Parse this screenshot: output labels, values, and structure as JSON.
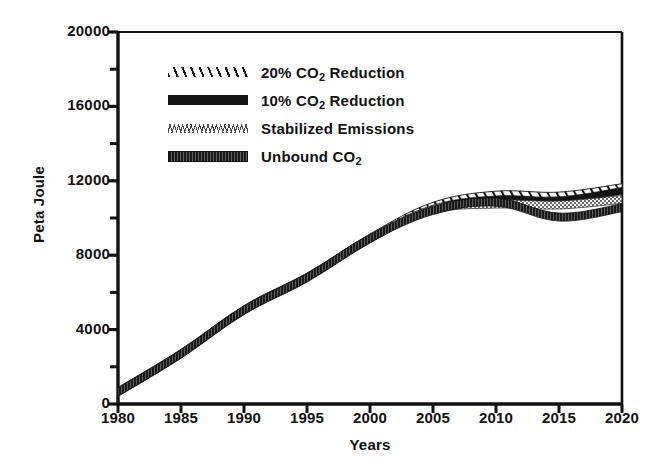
{
  "chart_data": {
    "type": "line",
    "title": "",
    "xlabel": "Years",
    "ylabel": "Peta Joule",
    "xlim": [
      1980,
      2020
    ],
    "ylim": [
      0,
      20000
    ],
    "xticks": [
      1980,
      1985,
      1990,
      1995,
      2000,
      2005,
      2010,
      2015,
      2020
    ],
    "yticks": [
      0,
      4000,
      8000,
      12000,
      16000,
      20000
    ],
    "y_minor_ticks": [
      2000,
      6000,
      10000,
      14000,
      18000
    ],
    "grid": false,
    "legend_position": "upper left inside",
    "x": [
      1980,
      1985,
      1990,
      1995,
      2000,
      2005,
      2010,
      2015,
      2020
    ],
    "series": [
      {
        "name": "20% CO2 Reduction",
        "label": "20% CO",
        "label_sub": "2",
        "label_tail": " Reduction",
        "style": "hatched",
        "values": [
          650,
          2700,
          5050,
          6800,
          8900,
          10600,
          11200,
          11150,
          11600
        ]
      },
      {
        "name": "10% CO2 Reduction",
        "label": "10% CO",
        "label_sub": "2",
        "label_tail": " Reduction",
        "style": "solid-thick",
        "values": [
          650,
          2700,
          5050,
          6800,
          8900,
          10500,
          11000,
          10950,
          11450
        ]
      },
      {
        "name": "Stabilized Emissions",
        "label": "Stabilized Emissions",
        "label_sub": "",
        "label_tail": "",
        "style": "dotted",
        "values": [
          650,
          2700,
          5050,
          6800,
          8900,
          10450,
          10750,
          10700,
          11000
        ]
      },
      {
        "name": "Unbound CO2",
        "label": "Unbound CO",
        "label_sub": "2",
        "label_tail": "",
        "style": "thick-textured",
        "values": [
          650,
          2700,
          5050,
          6800,
          8900,
          10400,
          10850,
          10050,
          10550
        ]
      }
    ]
  },
  "axes": {
    "ylabel": "Peta Joule",
    "xlabel": "Years",
    "ytick_labels": [
      "20000",
      "16000",
      "12000",
      "8000",
      "4000",
      "0"
    ],
    "xtick_labels": [
      "1980",
      "1985",
      "1990",
      "1995",
      "2000",
      "2005",
      "2010",
      "2015",
      "2020"
    ]
  },
  "colors": {
    "ink": "#111111",
    "background": "#ffffff"
  }
}
